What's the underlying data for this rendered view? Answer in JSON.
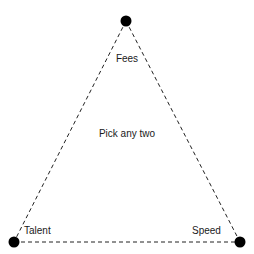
{
  "diagram": {
    "type": "constraint-triangle",
    "center_text": "Pick any two",
    "background_color": "#ffffff",
    "line_color": "#222222",
    "vertex_color": "#000000",
    "text_color": "#1a1a1a",
    "vertices": [
      {
        "id": "fees",
        "label": "Fees",
        "x": 126,
        "y": 21
      },
      {
        "id": "talent",
        "label": "Talent",
        "x": 14,
        "y": 242
      },
      {
        "id": "speed",
        "label": "Speed",
        "x": 240,
        "y": 242
      }
    ]
  }
}
